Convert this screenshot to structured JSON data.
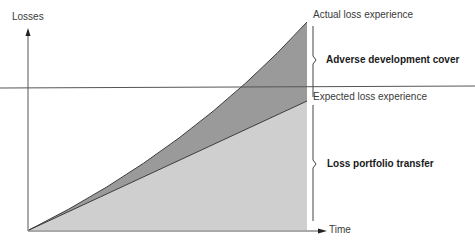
{
  "diagram": {
    "y_axis_label": "Losses",
    "x_axis_label": "Time",
    "curves": {
      "actual": "Actual loss experience",
      "expected": "Expected loss experience"
    },
    "regions": {
      "upper": "Adverse development cover",
      "lower": "Loss portfolio transfer"
    },
    "colors": {
      "upper_fill": "#9a9a9a",
      "lower_fill": "#cfcfcf",
      "axis": "#555555",
      "line": "#3a3a3a"
    }
  }
}
